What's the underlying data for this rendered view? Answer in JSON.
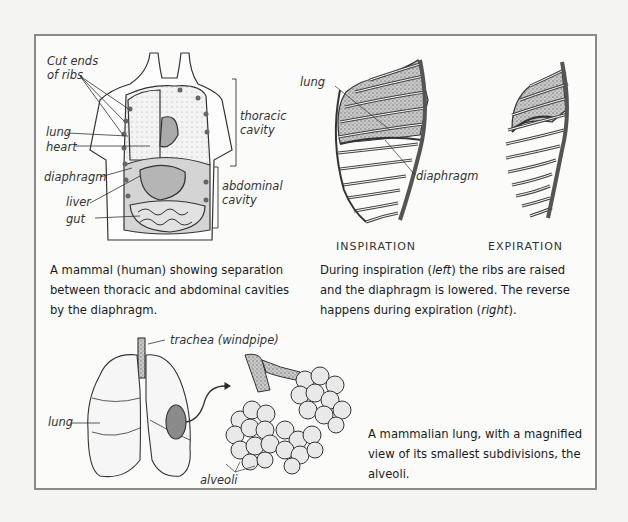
{
  "panels": {
    "torso": {
      "labels": {
        "cut_ends_of_ribs_line1": "Cut ends",
        "cut_ends_of_ribs_line2": "of ribs",
        "lung": "lung",
        "heart": "heart",
        "diaphragm": "diaphragm",
        "liver": "liver",
        "gut": "gut",
        "thoracic_line1": "thoracic",
        "thoracic_line2": "cavity",
        "abdominal_line1": "abdominal",
        "abdominal_line2": "cavity"
      },
      "caption": "A mammal (human) showing separation between thoracic and abdominal cavities by the diaphragm."
    },
    "ribcage": {
      "labels": {
        "lung": "lung",
        "diaphragm": "diaphragm",
        "inspiration": "INSPIRATION",
        "expiration": "EXPIRATION"
      },
      "caption": {
        "part1": "During inspiration (",
        "left": "left",
        "part2": ") the ribs are raised and the diaphragm is lowered. The reverse happens during expiration (",
        "right": "right",
        "part3": ")."
      }
    },
    "lungs": {
      "labels": {
        "trachea": "trachea (windpipe)",
        "lung": "lung",
        "alveoli": "alveoli"
      },
      "caption": "A mammalian lung, with a magnified view of its smallest subdivisions, the alveoli."
    }
  },
  "colors": {
    "background": "#f4f4f2",
    "frame_border": "#8a8a8a",
    "ink": "#222222",
    "stipple_fill": "#bdbdbd"
  }
}
